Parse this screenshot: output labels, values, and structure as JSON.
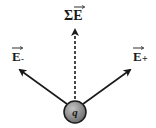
{
  "diagram": {
    "labels": {
      "sum_field": "ΣE",
      "field_minus": "E",
      "field_minus_sign": "-",
      "field_plus": "E",
      "field_plus_sign": "+",
      "charge": "q"
    },
    "colors": {
      "arrow": "#1a1a1a",
      "charge_fill": "#8a8a8a",
      "charge_stroke": "#1a1a1a",
      "background": "#ffffff"
    }
  }
}
